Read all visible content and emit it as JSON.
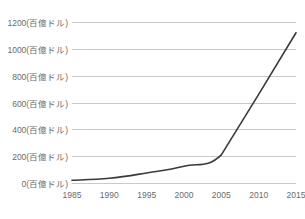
{
  "chart_data": {
    "type": "line",
    "title": "",
    "subtitle": "",
    "xlabel": "",
    "ylabel": "",
    "grid": true,
    "legend": false,
    "legend_position": "none",
    "unit_suffix": "(百億ドル)",
    "xlim": [
      1985,
      2015
    ],
    "ylim": [
      0,
      1200
    ],
    "xticks": [
      1985,
      1990,
      1995,
      2000,
      2005,
      2010,
      2015
    ],
    "yticks": [
      0,
      200,
      400,
      600,
      800,
      1000,
      1200
    ],
    "xtick_labels": [
      "1985",
      "1990",
      "1995",
      "2000",
      "2005",
      "2010",
      "2015"
    ],
    "ytick_labels": [
      "0(百億ドル)",
      "200(百億ドル)",
      "400(百億ドル)",
      "600(百億ドル)",
      "800(百億ドル)",
      "1000(百億ドル)",
      "1200(百億ドル)"
    ],
    "series": [
      {
        "name": "value",
        "color": "#3a3a3a",
        "line_width": 1.6,
        "x": [
          1985,
          1990,
          1995,
          2000,
          2005,
          2010,
          2015
        ],
        "values": [
          20,
          35,
          75,
          125,
          210,
          660,
          1120
        ]
      }
    ],
    "colors": {
      "line": "#3a3a3a",
      "grid": "#c9c9c9",
      "tick_text": "#6b6b6b",
      "background": "#ffffff"
    }
  }
}
